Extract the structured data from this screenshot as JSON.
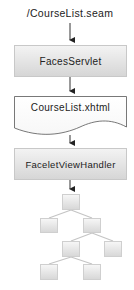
{
  "diagram": {
    "request_url": "/CourseList.seam",
    "steps": [
      {
        "label": "FacesServlet",
        "shape": "box"
      },
      {
        "label": "CourseList.xhtml",
        "shape": "document"
      },
      {
        "label": "FaceletViewHandler",
        "shape": "box"
      }
    ],
    "tree": {
      "description": "component tree",
      "nodes": 7
    },
    "colors": {
      "box_top": "#f3f3f3",
      "box_bottom": "#d6d6d6",
      "border": "#c8c8c8",
      "arrow": "#222222",
      "tree_line": "#c0c0c0"
    }
  }
}
